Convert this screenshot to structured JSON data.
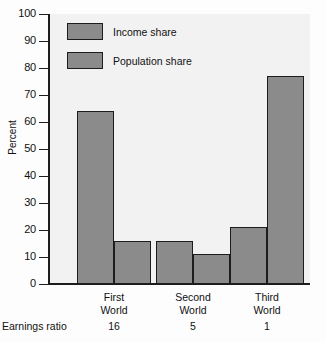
{
  "chart_data": {
    "type": "bar",
    "title": "",
    "xlabel": "",
    "ylabel": "Percent",
    "ylim": [
      0,
      100
    ],
    "ytick_labels": [
      "0",
      "10",
      "20",
      "30",
      "40",
      "50",
      "60",
      "70",
      "80",
      "90",
      "100"
    ],
    "ytick_values": [
      0,
      10,
      20,
      30,
      40,
      50,
      60,
      70,
      80,
      90,
      100
    ],
    "grid": false,
    "legend_position": "top-left",
    "categories": [
      "First World",
      "Second World",
      "Third World"
    ],
    "category_lines": [
      [
        "First",
        "World"
      ],
      [
        "Second",
        "World"
      ],
      [
        "Third",
        "World"
      ]
    ],
    "secondary_axis_caption": "Earnings ratio",
    "earnings_ratio": [
      "16",
      "5",
      "1"
    ],
    "series": [
      {
        "name": "Income share",
        "values": [
          64,
          16,
          21
        ]
      },
      {
        "name": "Population share",
        "values": [
          16,
          11,
          77
        ]
      }
    ],
    "colors": {
      "bar_fill": "#8b8b8b",
      "bar_border": "#1d1d1d",
      "plot_background": "#f2f2f2",
      "page_background": "#fdfdfd",
      "text": "#111111"
    }
  }
}
